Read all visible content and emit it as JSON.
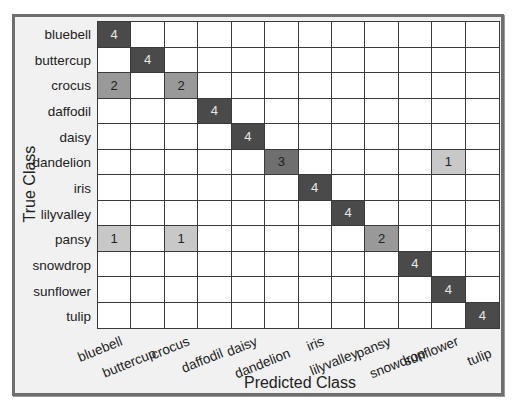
{
  "chart_data": {
    "type": "heatmap",
    "title": "",
    "xlabel": "Predicted Class",
    "ylabel": "True Class",
    "categories": [
      "bluebell",
      "buttercup",
      "crocus",
      "daffodil",
      "daisy",
      "dandelion",
      "iris",
      "lilyvalley",
      "pansy",
      "snowdrop",
      "sunflower",
      "tulip"
    ],
    "matrix": [
      [
        4,
        0,
        0,
        0,
        0,
        0,
        0,
        0,
        0,
        0,
        0,
        0
      ],
      [
        0,
        4,
        0,
        0,
        0,
        0,
        0,
        0,
        0,
        0,
        0,
        0
      ],
      [
        2,
        0,
        2,
        0,
        0,
        0,
        0,
        0,
        0,
        0,
        0,
        0
      ],
      [
        0,
        0,
        0,
        4,
        0,
        0,
        0,
        0,
        0,
        0,
        0,
        0
      ],
      [
        0,
        0,
        0,
        0,
        4,
        0,
        0,
        0,
        0,
        0,
        0,
        0
      ],
      [
        0,
        0,
        0,
        0,
        0,
        3,
        0,
        0,
        0,
        0,
        1,
        0
      ],
      [
        0,
        0,
        0,
        0,
        0,
        0,
        4,
        0,
        0,
        0,
        0,
        0
      ],
      [
        0,
        0,
        0,
        0,
        0,
        0,
        0,
        4,
        0,
        0,
        0,
        0
      ],
      [
        1,
        0,
        1,
        0,
        0,
        0,
        0,
        0,
        2,
        0,
        0,
        0
      ],
      [
        0,
        0,
        0,
        0,
        0,
        0,
        0,
        0,
        0,
        4,
        0,
        0
      ],
      [
        0,
        0,
        0,
        0,
        0,
        0,
        0,
        0,
        0,
        0,
        4,
        0
      ],
      [
        0,
        0,
        0,
        0,
        0,
        0,
        0,
        0,
        0,
        0,
        0,
        4
      ]
    ],
    "value_range": [
      0,
      4
    ],
    "colors": {
      "4": "#4a4a4a",
      "3": "#6f6f6f",
      "2": "#999999",
      "1": "#c8c8c8",
      "0": "#ffffff"
    },
    "text_colors": {
      "4": "#e8e8e8",
      "3": "#222222",
      "2": "#222222",
      "1": "#222222"
    }
  }
}
